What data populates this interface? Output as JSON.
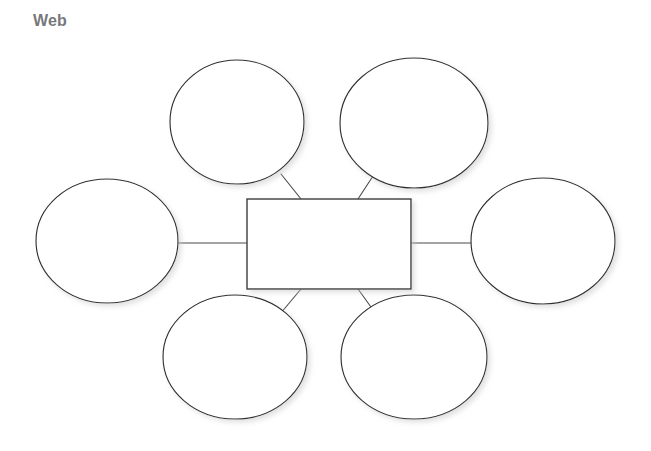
{
  "page": {
    "title": "Web",
    "background_color": "#ffffff",
    "title_color": "#77787a",
    "width": 651,
    "height": 451
  },
  "organizer": {
    "type": "web-graphic-organizer",
    "center": {
      "name": "center-topic-box",
      "shape": "rectangle",
      "label": "",
      "x": 247,
      "y": 199,
      "width": 164,
      "height": 90,
      "fill": "#f7f7f7",
      "stroke": "#3a3a3a"
    },
    "nodes": [
      {
        "name": "detail-bubble-top-left",
        "shape": "ellipse",
        "label": "",
        "cx": 237,
        "cy": 122,
        "rx": 67,
        "ry": 62
      },
      {
        "name": "detail-bubble-top-right",
        "shape": "ellipse",
        "label": "",
        "cx": 414,
        "cy": 123,
        "rx": 74,
        "ry": 65
      },
      {
        "name": "detail-bubble-left",
        "shape": "ellipse",
        "label": "",
        "cx": 107,
        "cy": 241,
        "rx": 71,
        "ry": 62
      },
      {
        "name": "detail-bubble-right",
        "shape": "ellipse",
        "label": "",
        "cx": 543,
        "cy": 241,
        "rx": 72,
        "ry": 63
      },
      {
        "name": "detail-bubble-bottom-left",
        "shape": "ellipse",
        "label": "",
        "cx": 235,
        "cy": 357,
        "rx": 72,
        "ry": 62
      },
      {
        "name": "detail-bubble-bottom-right",
        "shape": "ellipse",
        "label": "",
        "cx": 414,
        "cy": 357,
        "rx": 73,
        "ry": 62
      }
    ],
    "connectors": [
      {
        "name": "connector-center-to-top-left",
        "x1": 301,
        "y1": 199,
        "x2": 281,
        "y2": 174
      },
      {
        "name": "connector-center-to-top-right",
        "x1": 358,
        "y1": 199,
        "x2": 375,
        "y2": 173
      },
      {
        "name": "connector-center-to-left",
        "x1": 247,
        "y1": 243,
        "x2": 178,
        "y2": 243
      },
      {
        "name": "connector-center-to-right",
        "x1": 411,
        "y1": 243,
        "x2": 471,
        "y2": 243
      },
      {
        "name": "connector-center-to-bottom-left",
        "x1": 301,
        "y1": 289,
        "x2": 280,
        "y2": 314
      },
      {
        "name": "connector-center-to-bottom-right",
        "x1": 358,
        "y1": 289,
        "x2": 376,
        "y2": 314
      }
    ]
  }
}
